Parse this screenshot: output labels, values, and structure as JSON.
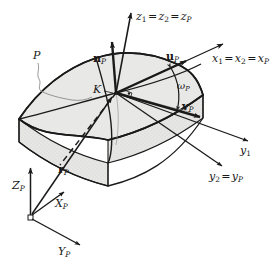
{
  "figure": {
    "background_color": "#ffffff",
    "line_color": "#1a1a1a",
    "surface_fill": "#e8e8e6",
    "side_fill": "#dedede",
    "leader_color": "#8a8a8a"
  },
  "labels": {
    "patch": {
      "text": "P",
      "style": "italic",
      "description": "surface patch identifier with wavy leader line"
    },
    "point_k": {
      "text": "K",
      "style": "italic",
      "description": "surface point at which the local frame is defined"
    },
    "normal_vector": {
      "symbol": "n",
      "subscript": "P",
      "bold": true,
      "description": "surface normal unit vector at K"
    },
    "u_vector": {
      "symbol": "u",
      "subscript": "P",
      "bold": true,
      "description": "first tangent vector in the surface at K"
    },
    "v_vector": {
      "symbol": "v",
      "subscript": "P",
      "bold": true,
      "description": "second tangent vector in the surface at K"
    },
    "r_vector": {
      "symbol": "r",
      "subscript": "P",
      "bold": true,
      "description": "position vector from global origin to K"
    },
    "omega_angle": {
      "symbol": "ω",
      "subscript": "P",
      "italic": true,
      "description": "angle between u_P and v_P measured in the tangent plane"
    },
    "axis_z": {
      "text": "z1 = z2 = zP",
      "parts": [
        {
          "sym": "z",
          "sub": "1"
        },
        {
          "eq": "="
        },
        {
          "sym": "z",
          "sub": "2"
        },
        {
          "eq": "="
        },
        {
          "sym": "z",
          "sub": "P"
        }
      ],
      "description": "vertical axis coincidence label"
    },
    "axis_x": {
      "text": "x1 = x2 = xP",
      "parts": [
        {
          "sym": "x",
          "sub": "1"
        },
        {
          "eq": "="
        },
        {
          "sym": "x",
          "sub": "2"
        },
        {
          "eq": "="
        },
        {
          "sym": "x",
          "sub": "P"
        }
      ],
      "description": "upper-right axis coincidence label"
    },
    "axis_y1": {
      "text": "y1",
      "parts": [
        {
          "sym": "y",
          "sub": "1"
        }
      ],
      "description": "first auxiliary y axis"
    },
    "axis_y2": {
      "text": "y2 = yP",
      "parts": [
        {
          "sym": "y",
          "sub": "2"
        },
        {
          "eq": "="
        },
        {
          "sym": "y",
          "sub": "P"
        }
      ],
      "description": "second y axis coincidence label"
    },
    "global_z": {
      "symbol": "Z",
      "subscript": "P",
      "italic": true,
      "description": "global frame vertical axis"
    },
    "global_x": {
      "symbol": "X",
      "subscript": "P",
      "italic": true,
      "description": "global frame X axis"
    },
    "global_y": {
      "symbol": "Y",
      "subscript": "P",
      "italic": true,
      "description": "global frame Y axis"
    }
  }
}
